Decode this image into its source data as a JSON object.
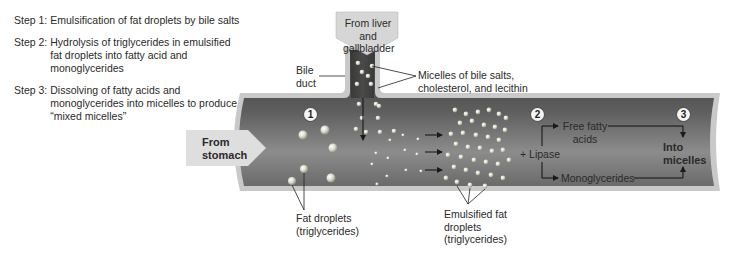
{
  "steps": [
    {
      "num": "Step 1:",
      "text": "Emulsification of fat droplets by bile salts"
    },
    {
      "num": "Step 2:",
      "text": "Hydrolysis of triglycerides in emulsified fat droplets into fatty acid and monoglycerides"
    },
    {
      "num": "Step 3:",
      "text": "Dissolving of fatty acids and monoglycerides into micelles to produce “mixed micelles”"
    }
  ],
  "labels": {
    "from_liver": "From liver and gallbladder",
    "bile_duct": "Bile duct",
    "micelles": "Micelles of bile salts, cholesterol, and lecithin",
    "from_stomach": "From stomach",
    "fat_droplets": "Fat droplets (triglycerides)",
    "emulsified": "Emulsified fat droplets (triglycerides)",
    "lipase": "+ Lipase",
    "free_fatty_acids": "Free fatty acids",
    "monoglycerides": "Monoglycerides",
    "into_micelles": "Into micelles"
  },
  "markers": [
    "1",
    "2",
    "3"
  ],
  "colors": {
    "tube_dark": "#3c3c3c",
    "tube_mid": "#8a8a8a",
    "tube_wall": "#c8c8c8",
    "arrow_fill": "#d9d9d9",
    "droplet": "#d8d8c8"
  }
}
